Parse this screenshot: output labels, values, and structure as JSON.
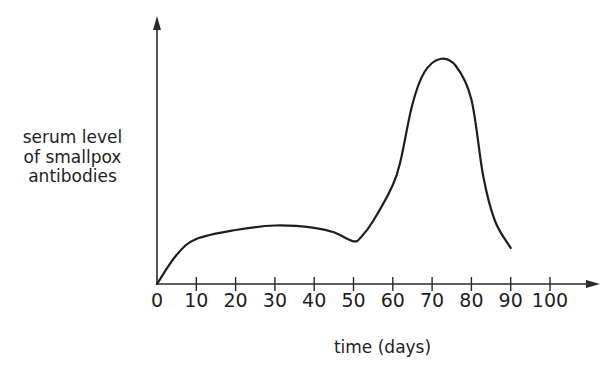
{
  "chart_data": {
    "type": "line",
    "title": "",
    "xlabel": "time (days)",
    "ylabel_lines": [
      "serum level",
      "of smallpox",
      "antibodies"
    ],
    "ylabel": "serum level of smallpox antibodies",
    "x_ticks": [
      0,
      10,
      20,
      30,
      40,
      50,
      60,
      70,
      80,
      90,
      100
    ],
    "xlim": [
      0,
      100
    ],
    "ylim": [
      0,
      100
    ],
    "y_ticks": [],
    "y_units": "relative (no scale shown)",
    "grid": false,
    "legend": null,
    "series": [
      {
        "name": "serum level of smallpox antibodies",
        "x": [
          0,
          5,
          10,
          20,
          30,
          40,
          45,
          50,
          52,
          55,
          60,
          62,
          65,
          68,
          72,
          76,
          80,
          83,
          86,
          90
        ],
        "values": [
          0,
          13,
          20,
          24,
          26,
          25,
          23,
          19,
          21,
          28,
          44,
          55,
          80,
          94,
          100,
          97,
          82,
          48,
          28,
          16
        ]
      }
    ],
    "annotations": []
  },
  "style": {
    "line_color": "#1e1e1e",
    "axis_color": "#2a2a2a",
    "background": "#ffffff"
  }
}
